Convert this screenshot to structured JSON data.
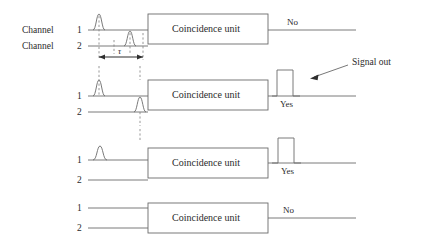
{
  "figure": {
    "unit_label": "Coincidence unit",
    "channel_label": "Channel",
    "channel_1_number": "1",
    "channel_2_number": "2",
    "tau_label": "τ",
    "signal_out_label": "Signal out",
    "verdict_no": "No",
    "verdict_yes": "Yes",
    "colors": {
      "line": "#6b6b6b",
      "dashed": "#7d7d7d",
      "arrow": "#2f2f2f",
      "text": "#2b2b2b",
      "background": "#ffffff"
    }
  },
  "rows": [
    {
      "id": "row-1",
      "unit_label": "Coincidence unit",
      "channel_1_number": "1",
      "channel_2_number": "2",
      "channel_1_has_pulse": true,
      "channel_2_has_pulse": true,
      "pulses_within_window": false,
      "output_pulse": false,
      "verdict": "No",
      "shows_channel_word": true,
      "shows_tau": true
    },
    {
      "id": "row-2",
      "unit_label": "Coincidence unit",
      "channel_1_number": "1",
      "channel_2_number": "2",
      "channel_1_has_pulse": true,
      "channel_2_has_pulse": true,
      "pulses_within_window": true,
      "output_pulse": true,
      "verdict": "Yes",
      "shows_channel_word": false,
      "shows_tau": false
    },
    {
      "id": "row-3",
      "unit_label": "Coincidence unit",
      "channel_1_number": "1",
      "channel_2_number": "2",
      "channel_1_has_pulse": true,
      "channel_2_has_pulse": false,
      "pulses_within_window": false,
      "output_pulse": true,
      "verdict": "Yes",
      "shows_channel_word": false,
      "shows_tau": false
    },
    {
      "id": "row-4",
      "unit_label": "Coincidence unit",
      "channel_1_number": "1",
      "channel_2_number": "2",
      "channel_1_has_pulse": false,
      "channel_2_has_pulse": false,
      "pulses_within_window": false,
      "output_pulse": false,
      "verdict": "No",
      "shows_channel_word": false,
      "shows_tau": false
    }
  ]
}
